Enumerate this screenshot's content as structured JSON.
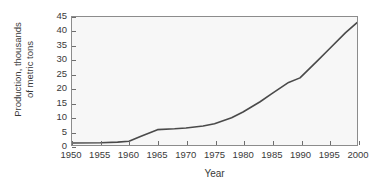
{
  "chart_data": {
    "type": "line",
    "title": "",
    "xlabel": "Year",
    "ylabel": "Production, thousands of metric tons",
    "ylabel_lines": [
      "Production, thousands",
      "of metric tons"
    ],
    "xlim": [
      1950,
      2000
    ],
    "ylim": [
      0,
      45
    ],
    "xticks": [
      1950,
      1955,
      1960,
      1965,
      1970,
      1975,
      1980,
      1985,
      1990,
      1995,
      2000
    ],
    "xtick_labels": [
      "1950",
      "1955",
      "1960",
      "1965",
      "1970",
      "1975",
      "1980",
      "1985",
      "1990",
      "1995",
      "2000"
    ],
    "yticks": [
      0,
      5,
      10,
      15,
      20,
      25,
      30,
      35,
      40,
      45
    ],
    "ytick_labels": [
      "0",
      "5",
      "10",
      "15",
      "20",
      "25",
      "30",
      "35",
      "40",
      "45"
    ],
    "grid": false,
    "legend": null,
    "series": [
      {
        "name": "Production",
        "color": "#4a4a4a",
        "x": [
          1950,
          1955,
          1958,
          1960,
          1962,
          1965,
          1968,
          1970,
          1973,
          1975,
          1978,
          1980,
          1983,
          1985,
          1988,
          1990,
          1993,
          1995,
          1998,
          2000
        ],
        "values": [
          0.7,
          0.8,
          1.0,
          1.3,
          3.0,
          5.4,
          5.7,
          6.0,
          6.7,
          7.5,
          9.6,
          11.6,
          15.2,
          18.0,
          22.0,
          23.6,
          29.5,
          33.5,
          39.5,
          43.0
        ]
      }
    ]
  },
  "colors": {
    "line": "#4a4a4a",
    "axis": "#8c8c8c",
    "tick": "#6e6e6e",
    "plot_background": "#f7f7f7",
    "figure_background": "#ffffff",
    "text": "#3a3a3a"
  }
}
